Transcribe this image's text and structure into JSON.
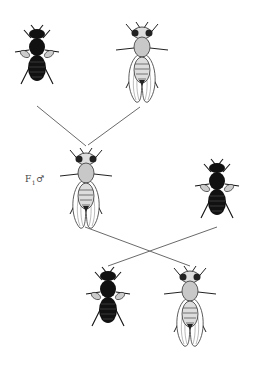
{
  "diagram": {
    "type": "genetic-cross",
    "labels": {
      "f1_male": "F",
      "f1_sub": "1",
      "f1_symbol": "♂"
    },
    "flies": [
      {
        "id": "parent-dark",
        "phenotype": "dark, vestigial wings",
        "x": 37,
        "y": 58
      },
      {
        "id": "parent-wildtype",
        "phenotype": "wild type, long wings",
        "x": 142,
        "y": 60
      },
      {
        "id": "f1-male",
        "phenotype": "wild type, long wings",
        "x": 86,
        "y": 185
      },
      {
        "id": "testcross-dark",
        "phenotype": "dark, vestigial wings",
        "x": 217,
        "y": 192
      },
      {
        "id": "offspring-dark",
        "phenotype": "dark, vestigial wings",
        "x": 108,
        "y": 300
      },
      {
        "id": "offspring-wildtype",
        "phenotype": "wild type, long wings",
        "x": 190,
        "y": 305
      }
    ],
    "colors": {
      "line": "#6a6a6a",
      "ink": "#111111",
      "wing": "#555555",
      "body_light": "#cfcfcf"
    }
  }
}
